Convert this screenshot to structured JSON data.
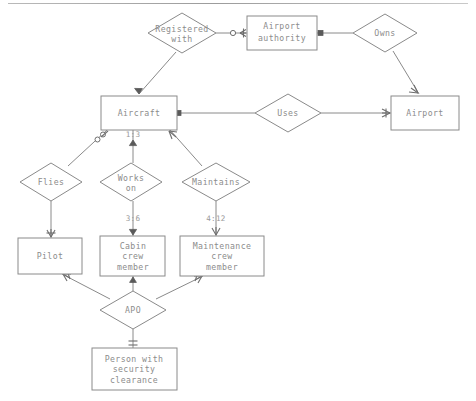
{
  "diagram": {
    "type": "entity-relationship",
    "colors": {
      "stroke": "#8a8a8a",
      "text": "#8c8c8c",
      "background": "#ffffff",
      "notation": "#6e6e6e"
    },
    "entities": [
      {
        "id": "airport_authority",
        "label": "Airport\nauthority",
        "lines": [
          "Airport",
          "authority"
        ],
        "x": 247,
        "y": 16,
        "w": 70,
        "h": 34
      },
      {
        "id": "airport",
        "label": "Airport",
        "lines": [
          "Airport"
        ],
        "x": 391,
        "y": 96,
        "w": 68,
        "h": 34
      },
      {
        "id": "aircraft",
        "label": "Aircraft",
        "lines": [
          "Aircraft"
        ],
        "x": 101,
        "y": 96,
        "w": 76,
        "h": 34
      },
      {
        "id": "pilot",
        "label": "Pilot",
        "lines": [
          "Pilot"
        ],
        "x": 18,
        "y": 238,
        "w": 64,
        "h": 36
      },
      {
        "id": "cabin_crew_member",
        "label": "Cabin\ncrew\nmember",
        "lines": [
          "Cabin",
          "crew",
          "member"
        ],
        "x": 100,
        "y": 236,
        "w": 65,
        "h": 40
      },
      {
        "id": "maintenance_crew_member",
        "label": "Maintenance\ncrew\nmember",
        "lines": [
          "Maintenance",
          "crew",
          "member"
        ],
        "x": 180,
        "y": 236,
        "w": 84,
        "h": 40
      },
      {
        "id": "person_security_clearance",
        "label": "Person with\nsecurity\nclearance",
        "lines": [
          "Person with",
          "security",
          "clearance"
        ],
        "x": 92,
        "y": 348,
        "w": 85,
        "h": 42
      }
    ],
    "relationships": [
      {
        "id": "registered_with",
        "label": "Registered\nwith",
        "lines": [
          "Registered",
          "with"
        ],
        "cx": 182,
        "cy": 33,
        "rx": 34,
        "ry": 20
      },
      {
        "id": "owns",
        "label": "Owns",
        "lines": [
          "Owns"
        ],
        "cx": 385,
        "cy": 33,
        "rx": 32,
        "ry": 19
      },
      {
        "id": "uses",
        "label": "Uses",
        "lines": [
          "Uses"
        ],
        "cx": 288,
        "cy": 113,
        "rx": 33,
        "ry": 19
      },
      {
        "id": "flies",
        "label": "Flies",
        "lines": [
          "Flies"
        ],
        "cx": 51,
        "cy": 182,
        "rx": 31,
        "ry": 19
      },
      {
        "id": "works_on",
        "label": "Works\non",
        "lines": [
          "Works",
          "on"
        ],
        "cx": 131,
        "cy": 182,
        "rx": 31,
        "ry": 19
      },
      {
        "id": "maintains",
        "label": "Maintains",
        "lines": [
          "Maintains"
        ],
        "cx": 216,
        "cy": 182,
        "rx": 34,
        "ry": 19
      },
      {
        "id": "apo",
        "label": "APO",
        "lines": [
          "APO"
        ],
        "cx": 133,
        "cy": 310,
        "rx": 33,
        "ry": 19
      }
    ],
    "cardinalities": [
      {
        "id": "aircraft_works_on",
        "text": "1:3",
        "x": 133,
        "y": 135
      },
      {
        "id": "works_on_cabin",
        "text": "3:6",
        "x": 133,
        "y": 219
      },
      {
        "id": "maintains_maintenance",
        "text": "4:12",
        "x": 216,
        "y": 219
      }
    ],
    "connections": [
      {
        "from": "registered_with",
        "to": "airport_authority",
        "notation_at_target": "optional-many"
      },
      {
        "from": "registered_with",
        "to": "aircraft",
        "notation_at_target": "arrow"
      },
      {
        "from": "airport_authority",
        "to": "owns",
        "notation_at_source": "one-bar"
      },
      {
        "from": "owns",
        "to": "airport",
        "notation_at_target": "many"
      },
      {
        "from": "aircraft",
        "to": "uses",
        "notation_at_source": "one-bar"
      },
      {
        "from": "uses",
        "to": "airport",
        "notation_at_target": "many"
      },
      {
        "from": "aircraft",
        "to": "flies",
        "notation_at_source": "optional-many"
      },
      {
        "from": "aircraft",
        "to": "works_on",
        "notation_at_source": "arrow"
      },
      {
        "from": "aircraft",
        "to": "maintains",
        "notation_at_source": "many"
      },
      {
        "from": "flies",
        "to": "pilot",
        "notation_at_target": "many"
      },
      {
        "from": "works_on",
        "to": "cabin_crew_member",
        "notation_at_target": "arrow"
      },
      {
        "from": "maintains",
        "to": "maintenance_crew_member",
        "notation_at_target": "many"
      },
      {
        "from": "apo",
        "to": "pilot",
        "notation_at_target": "many"
      },
      {
        "from": "apo",
        "to": "cabin_crew_member",
        "notation_at_target": "arrow"
      },
      {
        "from": "apo",
        "to": "maintenance_crew_member",
        "notation_at_target": "many"
      },
      {
        "from": "apo",
        "to": "person_security_clearance",
        "notation_at_target": "one-bar"
      }
    ]
  }
}
